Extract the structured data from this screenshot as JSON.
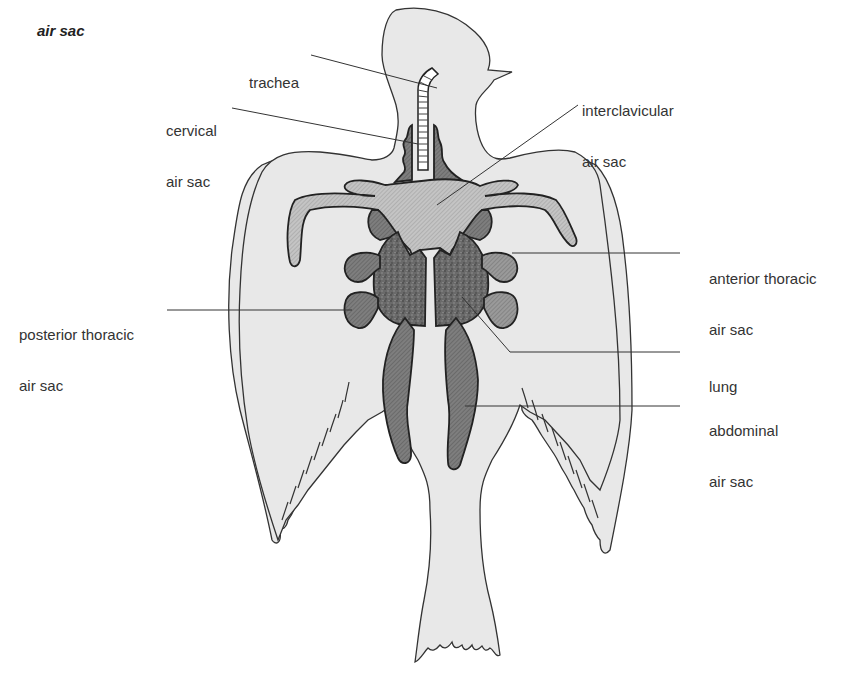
{
  "title": "air sac",
  "labels": {
    "trachea": {
      "line1": "trachea"
    },
    "cervical": {
      "line1": "cervical",
      "line2": "air sac"
    },
    "interclavicular": {
      "line1": "interclavicular",
      "line2": "air sac"
    },
    "anterior_thoracic": {
      "line1": "anterior thoracic",
      "line2": "air sac"
    },
    "posterior_thoracic": {
      "line1": "posterior thoracic",
      "line2": "air sac"
    },
    "lung": {
      "line1": "lung"
    },
    "abdominal": {
      "line1": "abdominal",
      "line2": "air sac"
    }
  },
  "colors": {
    "body": "#e8e8e8",
    "outline": "#333333",
    "sac_light": "#bdbdbd",
    "sac_mid": "#8c8c8c",
    "sac_dark": "#6e6e6e",
    "lung": "#5a5a5a"
  }
}
